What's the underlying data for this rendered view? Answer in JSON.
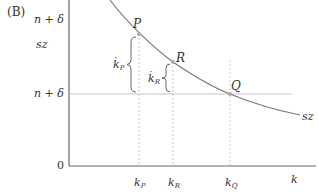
{
  "panel_label": "(B)",
  "y_axis": {
    "labels": [
      {
        "id": "top",
        "text": "n + δ"
      },
      {
        "id": "sz",
        "text": "sz"
      },
      {
        "id": "mid",
        "text": "n + δ"
      },
      {
        "id": "origin",
        "text": "0"
      }
    ]
  },
  "x_axis": {
    "label": "k",
    "ticks": [
      {
        "id": "kP",
        "base": "k",
        "sub": "P"
      },
      {
        "id": "kR",
        "base": "k",
        "sub": "R"
      },
      {
        "id": "kQ",
        "base": "k",
        "sub": "Q"
      }
    ]
  },
  "points": [
    {
      "id": "P",
      "label": "P"
    },
    {
      "id": "R",
      "label": "R"
    },
    {
      "id": "Q",
      "label": "Q"
    }
  ],
  "curve_label": "sz",
  "braces": [
    {
      "id": "kP_dot",
      "base": "k̇",
      "sub": "P"
    },
    {
      "id": "kR_dot",
      "base": "k̇",
      "sub": "R"
    }
  ],
  "colors": {
    "axis": "#555555",
    "curve": "#777777",
    "guide": "#bbbbbb",
    "hline": "#bbbbbb",
    "point": "#aaaaaa"
  }
}
